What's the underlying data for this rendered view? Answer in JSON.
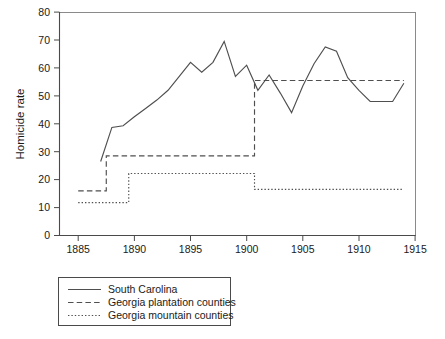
{
  "chart_data": {
    "type": "line",
    "title": "",
    "xlabel": "",
    "ylabel": "Homicide rate",
    "xlim": [
      1883,
      1916
    ],
    "ylim": [
      0,
      80
    ],
    "grid": false,
    "legend_position": "below-left",
    "x_ticks": [
      1885,
      1890,
      1895,
      1900,
      1905,
      1910,
      1915
    ],
    "x_tick_labels": [
      "1885",
      "1890",
      "1895",
      "1900",
      "1905",
      "1910",
      "1915"
    ],
    "y_ticks": [
      0,
      10,
      20,
      30,
      40,
      50,
      60,
      70,
      80
    ],
    "y_tick_labels": [
      "0",
      "10",
      "20",
      "30",
      "40",
      "50",
      "60",
      "70",
      "80"
    ],
    "series": [
      {
        "name": "South Carolina",
        "style": "solid",
        "x": [
          1887,
          1888,
          1889,
          1890,
          1891,
          1892,
          1893,
          1894,
          1895,
          1896,
          1897,
          1898,
          1899,
          1900,
          1901,
          1902,
          1903,
          1904,
          1905,
          1906,
          1907,
          1908,
          1909,
          1910,
          1911,
          1912,
          1913,
          1914
        ],
        "values": [
          26.5,
          38.7,
          39.3,
          42.5,
          45.5,
          48.5,
          52.0,
          57.0,
          62.0,
          58.5,
          62.0,
          69.5,
          57.0,
          61.0,
          52.0,
          57.5,
          51.0,
          44.0,
          53.5,
          61.5,
          67.5,
          66.0,
          56.5,
          52.0,
          48.0,
          48.0,
          48.0,
          54.5
        ]
      },
      {
        "name": "Georgia plantation counties",
        "style": "dashed",
        "step_segments": [
          {
            "x_start": 1885.0,
            "x_end": 1887.5,
            "value": 16.0
          },
          {
            "x_start": 1887.5,
            "x_end": 1900.7,
            "value": 28.5
          },
          {
            "x_start": 1900.7,
            "x_end": 1914.0,
            "value": 55.5
          }
        ]
      },
      {
        "name": "Georgia mountain counties",
        "style": "dotted",
        "step_segments": [
          {
            "x_start": 1885.0,
            "x_end": 1889.5,
            "value": 11.8
          },
          {
            "x_start": 1889.5,
            "x_end": 1900.7,
            "value": 22.2
          },
          {
            "x_start": 1900.7,
            "x_end": 1914.0,
            "value": 16.5
          }
        ]
      }
    ],
    "legend_entries": [
      {
        "label": "South Carolina",
        "style": "solid"
      },
      {
        "label": "Georgia plantation counties",
        "style": "dashed"
      },
      {
        "label": "Georgia mountain counties",
        "style": "dotted"
      }
    ]
  }
}
